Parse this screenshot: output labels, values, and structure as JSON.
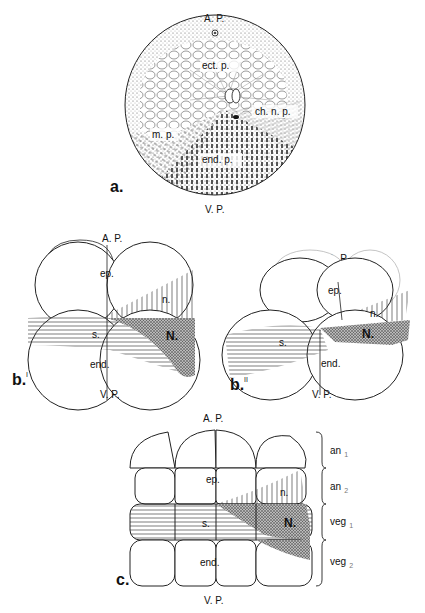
{
  "panel_a": {
    "label": "a.",
    "top_pole": "A. P.",
    "bottom_pole": "V. P.",
    "regions": {
      "ectoderm": "ect. p.",
      "chordaneural": "ch. n. p.",
      "mesoderm": "m. p.",
      "endoderm": "end. p."
    }
  },
  "panel_b1": {
    "label": "b.",
    "superscript": "I",
    "top_pole": "A. P.",
    "bottom_pole": "V. P.",
    "regions": {
      "ep": "ep.",
      "n": "n.",
      "N": "N.",
      "s": "s.",
      "end": "end."
    }
  },
  "panel_b2": {
    "label": "b.",
    "superscript": "II",
    "top_pole": "A. P.",
    "bottom_pole": "V. P.",
    "regions": {
      "ep": "ep.",
      "n": "n.",
      "N": "N.",
      "s": "s.",
      "end": "end."
    }
  },
  "panel_c": {
    "label": "c.",
    "top_pole": "A. P.",
    "bottom_pole": "V. P.",
    "regions": {
      "ep": "ep.",
      "n": "n.",
      "N": "N.",
      "s": "s.",
      "end": "end."
    },
    "tiers": [
      {
        "name": "an",
        "sub": "1"
      },
      {
        "name": "an",
        "sub": "2"
      },
      {
        "name": "veg",
        "sub": "1"
      },
      {
        "name": "veg",
        "sub": "2"
      }
    ]
  }
}
